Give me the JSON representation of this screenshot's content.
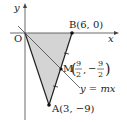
{
  "diagram": {
    "axes": {
      "x_label": "x",
      "y_label": "y",
      "origin_label": "O"
    },
    "points": {
      "O": {
        "label": "O",
        "coords": [
          0,
          0
        ]
      },
      "B": {
        "label": "B(6, 0)",
        "coords": [
          6,
          0
        ]
      },
      "A": {
        "label": "A(3, −9)",
        "coords": [
          3,
          -9
        ]
      },
      "M": {
        "label_prefix": "M",
        "x_num": "9",
        "x_den": "2",
        "sep": ",",
        "y_sign": "−",
        "y_num": "9",
        "y_den": "2",
        "coords": [
          4.5,
          -4.5
        ]
      }
    },
    "line": {
      "label": "y = mx"
    },
    "shaded_region": "triangle OAB",
    "colors": {
      "fill": "#d4d4d4",
      "stroke": "#222222"
    }
  }
}
